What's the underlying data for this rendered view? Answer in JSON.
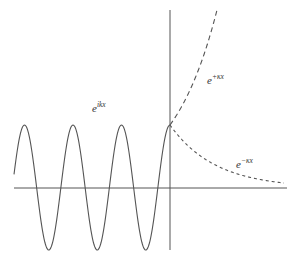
{
  "diagram": {
    "colors": {
      "line": "#555555",
      "background": "#ffffff"
    },
    "labels": {
      "oscillating": {
        "base": "e",
        "exponent": "ikx"
      },
      "growing": {
        "base": "e",
        "exponent": "+κx"
      },
      "decaying": {
        "base": "e",
        "exponent": "−κx"
      }
    }
  }
}
